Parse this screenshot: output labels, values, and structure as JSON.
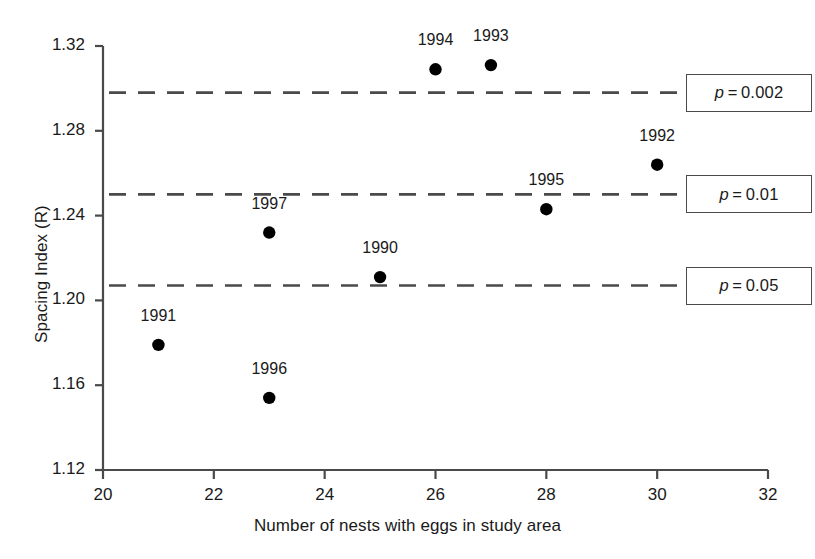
{
  "chart_data": {
    "type": "scatter",
    "title": "",
    "xlabel": "Number of nests with eggs in study area",
    "ylabel": "Spacing Index (R)",
    "xlim": [
      20,
      32
    ],
    "ylim": [
      1.12,
      1.32
    ],
    "xticks": [
      20,
      22,
      24,
      26,
      28,
      30,
      32
    ],
    "xtick_labels": [
      "20",
      "22",
      "24",
      "26",
      "28",
      "30",
      "32"
    ],
    "yticks": [
      1.12,
      1.16,
      1.2,
      1.24,
      1.28,
      1.32
    ],
    "ytick_labels": [
      "1.12",
      "1.16",
      "1.20",
      "1.24",
      "1.28",
      "1.32"
    ],
    "grid": false,
    "legend": "none",
    "marker": "filled-circle",
    "marker_color": "#000000",
    "points": [
      {
        "label": "1991",
        "x": 21,
        "y": 1.179
      },
      {
        "label": "1996",
        "x": 23,
        "y": 1.154
      },
      {
        "label": "1997",
        "x": 23,
        "y": 1.232
      },
      {
        "label": "1990",
        "x": 25,
        "y": 1.211
      },
      {
        "label": "1994",
        "x": 26,
        "y": 1.309
      },
      {
        "label": "1993",
        "x": 27,
        "y": 1.311
      },
      {
        "label": "1995",
        "x": 28,
        "y": 1.243
      },
      {
        "label": "1992",
        "x": 30,
        "y": 1.264
      }
    ],
    "reference_lines": [
      {
        "name": "p = 0.002",
        "p_value": "0.002",
        "y": 1.298,
        "style": "dashed"
      },
      {
        "name": "p = 0.01",
        "p_value": "0.01",
        "y": 1.25,
        "style": "dashed"
      },
      {
        "name": "p = 0.05",
        "p_value": "0.05",
        "y": 1.207,
        "style": "dashed"
      }
    ],
    "annotation_boxes": [
      {
        "text": "p = 0.002",
        "symbol": "p",
        "operator": "=",
        "value": "0.002"
      },
      {
        "text": "p = 0.01",
        "symbol": "p",
        "operator": "=",
        "value": "0.01"
      },
      {
        "text": "p = 0.05",
        "symbol": "p",
        "operator": "=",
        "value": "0.05"
      }
    ],
    "colors": {
      "axis": "#4a4a4a",
      "text": "#1a1a1a",
      "marker": "#000000",
      "dashed_line": "#4a4a4a",
      "box_border": "#4a4a4a",
      "background": "#ffffff"
    }
  }
}
